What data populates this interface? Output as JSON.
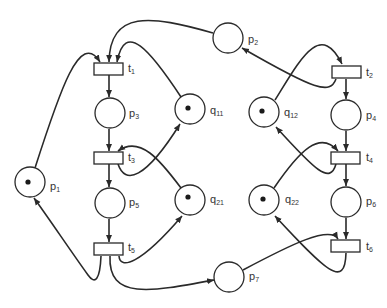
{
  "diagram": {
    "type": "petri-net",
    "places": [
      {
        "id": "p1",
        "label": "p",
        "sub": "1",
        "tokens": 1
      },
      {
        "id": "p2",
        "label": "p",
        "sub": "2",
        "tokens": 0
      },
      {
        "id": "p3",
        "label": "p",
        "sub": "3",
        "tokens": 0
      },
      {
        "id": "p4",
        "label": "p",
        "sub": "4",
        "tokens": 0
      },
      {
        "id": "p5",
        "label": "p",
        "sub": "5",
        "tokens": 0
      },
      {
        "id": "p6",
        "label": "p",
        "sub": "6",
        "tokens": 0
      },
      {
        "id": "p7",
        "label": "p",
        "sub": "7",
        "tokens": 0
      },
      {
        "id": "q11",
        "label": "q",
        "sub": "11",
        "tokens": 1
      },
      {
        "id": "q12",
        "label": "q",
        "sub": "12",
        "tokens": 1
      },
      {
        "id": "q21",
        "label": "q",
        "sub": "21",
        "tokens": 1
      },
      {
        "id": "q22",
        "label": "q",
        "sub": "22",
        "tokens": 1
      }
    ],
    "transitions": [
      {
        "id": "t1",
        "label": "t",
        "sub": "1"
      },
      {
        "id": "t2",
        "label": "t",
        "sub": "2"
      },
      {
        "id": "t3",
        "label": "t",
        "sub": "3"
      },
      {
        "id": "t4",
        "label": "t",
        "sub": "4"
      },
      {
        "id": "t5",
        "label": "t",
        "sub": "5"
      },
      {
        "id": "t6",
        "label": "t",
        "sub": "6"
      }
    ],
    "arcs": [
      [
        "p1",
        "t1"
      ],
      [
        "p2",
        "t1"
      ],
      [
        "q11",
        "t1"
      ],
      [
        "t1",
        "p3"
      ],
      [
        "p3",
        "t3"
      ],
      [
        "t3",
        "q11"
      ],
      [
        "q21",
        "t3"
      ],
      [
        "t3",
        "p5"
      ],
      [
        "p5",
        "t5"
      ],
      [
        "t5",
        "q21"
      ],
      [
        "t5",
        "p1"
      ],
      [
        "t5",
        "p7"
      ],
      [
        "p7",
        "t6"
      ],
      [
        "p6",
        "t6"
      ],
      [
        "t6",
        "q22"
      ],
      [
        "t2",
        "p2"
      ],
      [
        "q12",
        "t2"
      ],
      [
        "t2",
        "p4"
      ],
      [
        "p4",
        "t4"
      ],
      [
        "t4",
        "q12"
      ],
      [
        "q22",
        "t4"
      ],
      [
        "t4",
        "p6"
      ]
    ],
    "colors": {
      "stroke": "#2a2a2a",
      "fill": "#ffffff"
    }
  }
}
